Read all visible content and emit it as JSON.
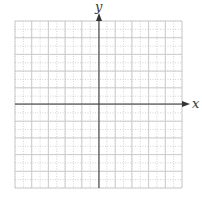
{
  "diagram": {
    "type": "coordinate-plane",
    "x_axis_label": "x",
    "y_axis_label": "y",
    "grid": {
      "columns": 20,
      "rows": 20,
      "left": 15,
      "top": 21,
      "right": 182,
      "bottom": 188,
      "major_every": 2,
      "major_color": "#c8c8c8",
      "minor_color": "#c8c8c8"
    },
    "origin": {
      "x": 99,
      "y": 104
    },
    "axis_color": "#333333",
    "has_arrow_x": true,
    "has_arrow_y": true
  }
}
